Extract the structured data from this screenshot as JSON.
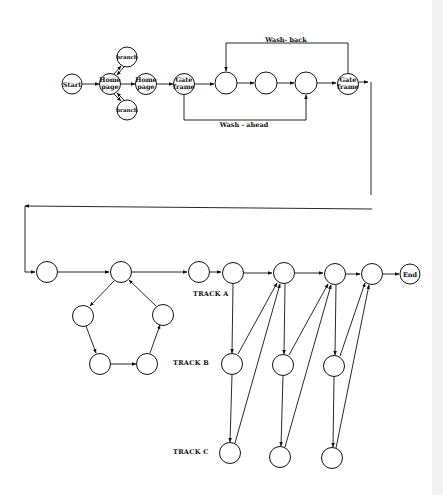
{
  "diagram": {
    "type": "flow-network",
    "colors": {
      "ink": "#111111",
      "background": "#ffffff",
      "edge_strip": "#f2f2f2"
    },
    "top_section": {
      "nodes": [
        {
          "id": "start",
          "label": [
            "Start"
          ]
        },
        {
          "id": "home1",
          "label": [
            "Home",
            "page"
          ]
        },
        {
          "id": "branch_top",
          "label": [
            "branch"
          ]
        },
        {
          "id": "branch_bottom",
          "label": [
            "branch"
          ]
        },
        {
          "id": "home2",
          "label": [
            "Home",
            "page"
          ]
        },
        {
          "id": "gate1",
          "label": [
            "Gate",
            "frame"
          ]
        },
        {
          "id": "frame_a",
          "label": []
        },
        {
          "id": "frame_b",
          "label": []
        },
        {
          "id": "frame_c",
          "label": []
        },
        {
          "id": "gate2",
          "label": [
            "Gate",
            "frame"
          ]
        }
      ],
      "loop_labels": {
        "wash_back": "Wash- back",
        "wash_ahead": "Wash - ahead"
      }
    },
    "bottom_section": {
      "track_labels": {
        "a": "TRACK A",
        "b": "TRACK B",
        "c": "TRACK C"
      },
      "end_label": "End"
    },
    "labels": {
      "start_l1": "Start",
      "home1_l1": "Home",
      "home1_l2": "page",
      "branch_top": "branch",
      "branch_bottom": "branch",
      "home2_l1": "Home",
      "home2_l2": "page",
      "gate1_l1": "Gate",
      "gate1_l2": "frame",
      "gate2_l1": "Gate",
      "gate2_l2": "frame",
      "wash_back": "Wash- back",
      "wash_ahead": "Wash - ahead",
      "track_a": "TRACK A",
      "track_b": "TRACK B",
      "track_c": "TRACK C",
      "end": "End"
    }
  }
}
